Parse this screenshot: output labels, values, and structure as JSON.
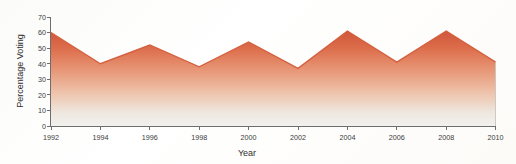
{
  "chart_data": {
    "type": "area",
    "title": "",
    "xlabel": "Year",
    "ylabel": "Percentage Voting",
    "categories": [
      1992,
      1994,
      1996,
      1998,
      2000,
      2002,
      2004,
      2006,
      2008,
      2010
    ],
    "values": [
      60,
      40,
      52,
      38,
      54,
      37,
      61,
      41,
      61,
      41
    ],
    "series": [
      {
        "name": "Percentage Voting",
        "values": [
          60,
          40,
          52,
          38,
          54,
          37,
          61,
          41,
          61,
          41
        ]
      }
    ],
    "x": [
      1992,
      1994,
      1996,
      1998,
      2000,
      2002,
      2004,
      2006,
      2008,
      2010
    ],
    "xlim": [
      1992,
      2010
    ],
    "ylim": [
      0,
      70
    ],
    "x_ticks": [
      "1992",
      "1994",
      "1996",
      "1998",
      "2000",
      "2002",
      "2004",
      "2006",
      "2008",
      "2010"
    ],
    "y_ticks": [
      "0",
      "10",
      "20",
      "30",
      "40",
      "50",
      "60",
      "70"
    ],
    "y_tick_values": [
      0,
      10,
      20,
      30,
      40,
      50,
      60,
      70
    ],
    "grid": false,
    "legend": false,
    "legend_position": "none",
    "area_fill_top_color": "#d9603c",
    "area_fill_bottom_color": "#f2f0ec",
    "line_color": "#d4603f",
    "axis_color": "#6e6e6e",
    "text_color": "#2e2e2e",
    "background_color": "#ffffff"
  },
  "labels": {
    "y_axis_title": "Percentage Voting",
    "x_axis_title": "Year"
  }
}
